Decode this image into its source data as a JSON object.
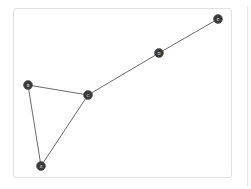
{
  "graph": {
    "nodes": [
      {
        "id": "A",
        "label": "A",
        "x": 41,
        "y": 166
      },
      {
        "id": "B",
        "label": "B",
        "x": 28,
        "y": 85
      },
      {
        "id": "C",
        "label": "C",
        "x": 88,
        "y": 95
      },
      {
        "id": "D",
        "label": "D",
        "x": 159,
        "y": 53
      },
      {
        "id": "E",
        "label": "E",
        "x": 218,
        "y": 19
      }
    ],
    "edges": [
      {
        "from": "B",
        "to": "C"
      },
      {
        "from": "B",
        "to": "A"
      },
      {
        "from": "A",
        "to": "C"
      },
      {
        "from": "C",
        "to": "D"
      },
      {
        "from": "D",
        "to": "E"
      }
    ]
  },
  "colors": {
    "node_fill": "#3a3a3a",
    "edge": "#6a6a6a",
    "frame_border": "#e2e2e2"
  }
}
